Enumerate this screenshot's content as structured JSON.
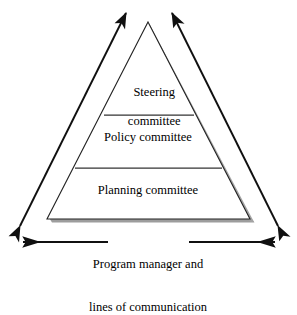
{
  "diagram": {
    "colors": {
      "stroke": "#1a1a1a",
      "tier_divider": "#3a3a3a",
      "shadow": "#9a9a9a",
      "fill": "#ffffff",
      "text": "#000000"
    },
    "pyramid": {
      "apex": {
        "x": 148,
        "y": 22
      },
      "base_left": {
        "x": 47,
        "y": 219
      },
      "base_right": {
        "x": 250,
        "y": 219
      },
      "tiers": [
        {
          "id": "steering",
          "label_line1": "Steering",
          "label_line2": "committee",
          "divider_y": 115,
          "divider_x1": 104,
          "divider_x2": 194
        },
        {
          "id": "policy",
          "label_line1": "Policy committee",
          "label_line2": "",
          "divider_y": 168,
          "divider_x1": 75,
          "divider_x2": 222
        },
        {
          "id": "planning",
          "label_line1": "Planning committee",
          "label_line2": "",
          "divider_y": 219,
          "divider_x1": 47,
          "divider_x2": 250
        }
      ]
    },
    "arrows": {
      "left_diagonal": {
        "name": "left-growth-arrow",
        "top_tip": {
          "x": 128,
          "y": 11
        },
        "bottom_tip": {
          "x": 18,
          "y": 228
        },
        "double_headed": true
      },
      "right_diagonal": {
        "name": "right-growth-arrow",
        "top_tip": {
          "x": 170,
          "y": 11
        },
        "bottom_tip": {
          "x": 280,
          "y": 228
        },
        "double_headed": true
      },
      "bottom_horizontal": {
        "name": "communication-arrow",
        "y": 242,
        "left_tip": {
          "x": 21,
          "y": 242
        },
        "right_tip": {
          "x": 277,
          "y": 242
        },
        "double_headed": true
      }
    },
    "caption": {
      "line1": "Program manager and",
      "line2": "lines of communication"
    }
  }
}
